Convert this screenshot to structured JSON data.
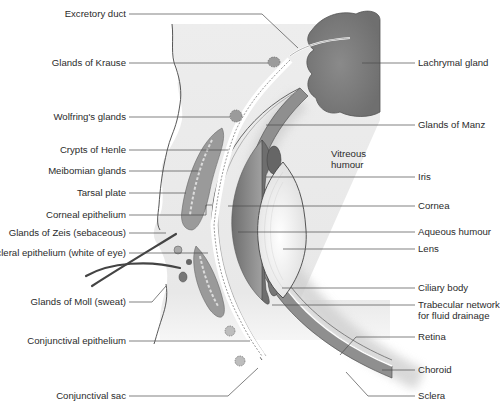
{
  "figure": {
    "colors": {
      "skin": "#ececec",
      "tissue_dark": "#8c8c8c",
      "gland": "#7d7d7d",
      "lens": "#efefef",
      "leader_line": "#4a4a4a",
      "text": "#2b2b2b"
    }
  },
  "labels_left": [
    {
      "text": "Excretory duct",
      "y": 14
    },
    {
      "text": "Glands of Krause",
      "y": 63
    },
    {
      "text": "Wolfring's glands",
      "y": 117
    },
    {
      "text": "Crypts of Henle",
      "y": 150
    },
    {
      "text": "Meibomian glands",
      "y": 171
    },
    {
      "text": "Tarsal plate",
      "y": 193
    },
    {
      "text": "Corneal epithelium",
      "y": 215
    },
    {
      "text": "Glands of Zeis (sebaceous)",
      "y": 233
    },
    {
      "text": "Scleral epithelium (white of eye)",
      "y": 253
    },
    {
      "text": "Glands of Moll (sweat)",
      "y": 302
    },
    {
      "text": "Conjunctival epithelium",
      "y": 341
    },
    {
      "text": "Conjunctival sac",
      "y": 396
    }
  ],
  "labels_right": [
    {
      "text": "Lachrymal gland",
      "y": 63
    },
    {
      "text": "Glands of Manz",
      "y": 125
    },
    {
      "text": "Vitreous humour",
      "y": 160
    },
    {
      "text": "Iris",
      "y": 177
    },
    {
      "text": "Cornea",
      "y": 206
    },
    {
      "text": "Aqueous humour",
      "y": 232
    },
    {
      "text": "Lens",
      "y": 249
    },
    {
      "text": "Ciliary body",
      "y": 288
    },
    {
      "text": "Trabecular network for fluid drainage",
      "y": 305
    },
    {
      "text": "Retina",
      "y": 337
    },
    {
      "text": "Choroid",
      "y": 370
    },
    {
      "text": "Sclera",
      "y": 396
    }
  ],
  "text": {
    "excretory_duct": "Excretory duct",
    "glands_krause": "Glands of Krause",
    "wolfring": "Wolfring's glands",
    "crypts_henle": "Crypts of Henle",
    "meibomian": "Meibomian glands",
    "tarsal": "Tarsal plate",
    "corneal_epi": "Corneal epithelium",
    "zeis": "Glands of Zeis (sebaceous)",
    "scleral_epi": "Scleral epithelium (white of eye)",
    "moll": "Glands of Moll (sweat)",
    "conj_epi": "Conjunctival epithelium",
    "conj_sac": "Conjunctival sac",
    "lachrymal": "Lachrymal gland",
    "manz": "Glands of Manz",
    "vitreous_1": "Vitreous",
    "vitreous_2": "humour",
    "iris": "Iris",
    "cornea": "Cornea",
    "aqueous": "Aqueous humour",
    "lens": "Lens",
    "ciliary": "Ciliary body",
    "trabecular_1": "Trabecular network",
    "trabecular_2": "for fluid drainage",
    "retina": "Retina",
    "choroid": "Choroid",
    "sclera": "Sclera"
  }
}
